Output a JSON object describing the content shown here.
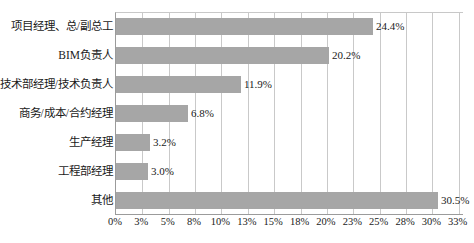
{
  "chart_data": {
    "type": "bar",
    "orientation": "horizontal",
    "title": "",
    "subtitle": "",
    "xlabel": "",
    "ylabel": "",
    "categories": [
      "项目经理、总/副总工",
      "BIM负责人",
      "技术部经理/技术负责人",
      "商务/成本/合约经理",
      "生产经理",
      "工程部经理",
      "其他"
    ],
    "values": [
      24.4,
      20.2,
      11.9,
      6.8,
      3.2,
      3.0,
      30.5
    ],
    "value_labels": [
      "24.4%",
      "20.2%",
      "11.9%",
      "6.8%",
      "3.2%",
      "3.0%",
      "30.5%"
    ],
    "xlim": [
      0,
      33
    ],
    "xtick_values": [
      0,
      2.5,
      5,
      7.5,
      10,
      12.5,
      15,
      17.5,
      20,
      22.5,
      25,
      27.5,
      30,
      32.5
    ],
    "xtick_labels": [
      "0%",
      "3%",
      "5%",
      "8%",
      "10%",
      "13%",
      "15%",
      "18%",
      "20%",
      "23%",
      "25%",
      "28%",
      "30%",
      "33%"
    ],
    "grid": true,
    "grid_axis": "x",
    "legend": false,
    "legend_position": "none",
    "bar_color": "#a6a6a6",
    "grid_color": "#c9c9c9",
    "axis_color": "#9b9b9b",
    "background_color": "#ffffff",
    "text_color": "#1a1a1a"
  }
}
